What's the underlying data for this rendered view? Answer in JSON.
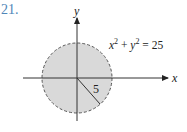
{
  "problem_number": "21.",
  "axes": {
    "x_label": "x",
    "y_label": "y"
  },
  "equation": {
    "x_var": "x",
    "exp1": "2",
    "plus": " + ",
    "y_var": "y",
    "exp2": "2",
    "equals": " = 25"
  },
  "radius_label": "5",
  "colors": {
    "fill": "#d9d9d9",
    "stroke": "#555555",
    "axis": "#333333",
    "number": "#4f86b8"
  }
}
